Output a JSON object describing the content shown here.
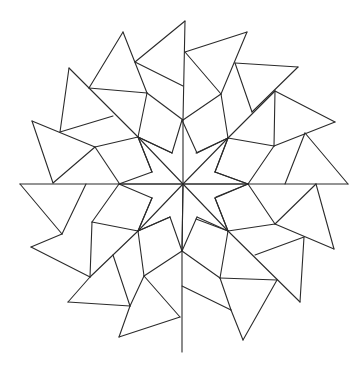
{
  "drawing": {
    "title": "Rotational geometric mandala line drawing",
    "stroke_color": "#2b2b2b",
    "background_color": "#ffffff",
    "center": [
      183,
      184
    ],
    "segments": [
      [
        185,
        21,
        135,
        62
      ],
      [
        185,
        21,
        183,
        120
      ],
      [
        135,
        62,
        183,
        86
      ],
      [
        123,
        32,
        89,
        88
      ],
      [
        123,
        32,
        147,
        93
      ],
      [
        89,
        88,
        147,
        93
      ],
      [
        147,
        93,
        138,
        137
      ],
      [
        147,
        93,
        183,
        120
      ],
      [
        69,
        68,
        60,
        132
      ],
      [
        69,
        68,
        138,
        137
      ],
      [
        60,
        132,
        113,
        116
      ],
      [
        32,
        121,
        53,
        183
      ],
      [
        32,
        121,
        95,
        147
      ],
      [
        95,
        147,
        53,
        183
      ],
      [
        95,
        147,
        138,
        137
      ],
      [
        95,
        147,
        119,
        183
      ],
      [
        138,
        137,
        172,
        153
      ],
      [
        138,
        137,
        152,
        172
      ],
      [
        185,
        52,
        247,
        32
      ],
      [
        247,
        32,
        221,
        94
      ],
      [
        185,
        52,
        221,
        94
      ],
      [
        183,
        120,
        221,
        94
      ],
      [
        235,
        63,
        298,
        67
      ],
      [
        298,
        67,
        252,
        112
      ],
      [
        235,
        63,
        252,
        112
      ],
      [
        221,
        94,
        228,
        138
      ],
      [
        275,
        91,
        335,
        122
      ],
      [
        275,
        91,
        274,
        146
      ],
      [
        335,
        122,
        274,
        146
      ],
      [
        275,
        91,
        228,
        138
      ],
      [
        228,
        138,
        274,
        146
      ],
      [
        228,
        138,
        196,
        153
      ],
      [
        228,
        138,
        215,
        172
      ],
      [
        305,
        133,
        348,
        184
      ],
      [
        305,
        133,
        285,
        184
      ],
      [
        274,
        146,
        248,
        184
      ],
      [
        20,
        184,
        348,
        184
      ],
      [
        248,
        184,
        215,
        172
      ],
      [
        248,
        184,
        216,
        197
      ],
      [
        316,
        184,
        334,
        249
      ],
      [
        316,
        184,
        275,
        224
      ],
      [
        248,
        184,
        275,
        224
      ],
      [
        275,
        224,
        228,
        231
      ],
      [
        334,
        249,
        275,
        224
      ],
      [
        304,
        237,
        255,
        255
      ],
      [
        304,
        237,
        300,
        302
      ],
      [
        228,
        231,
        300,
        302
      ],
      [
        228,
        231,
        215,
        198
      ],
      [
        228,
        231,
        196,
        219
      ],
      [
        228,
        231,
        220,
        278
      ],
      [
        220,
        278,
        277,
        280
      ],
      [
        277,
        280,
        243,
        340
      ],
      [
        220,
        278,
        231,
        310
      ],
      [
        231,
        310,
        243,
        340
      ],
      [
        231,
        310,
        182,
        286
      ],
      [
        182,
        251,
        220,
        278
      ],
      [
        182,
        251,
        182,
        352
      ],
      [
        182,
        251,
        183,
        184
      ],
      [
        20,
        184,
        62,
        234
      ],
      [
        86,
        184,
        62,
        234
      ],
      [
        119,
        184,
        92,
        222
      ],
      [
        92,
        222,
        138,
        231
      ],
      [
        92,
        222,
        90,
        277
      ],
      [
        31,
        247,
        62,
        234
      ],
      [
        31,
        247,
        90,
        277
      ],
      [
        90,
        277,
        138,
        231
      ],
      [
        138,
        231,
        152,
        198
      ],
      [
        138,
        231,
        170,
        217
      ],
      [
        138,
        231,
        144,
        276
      ],
      [
        144,
        276,
        182,
        251
      ],
      [
        113,
        255,
        130,
        306
      ],
      [
        90,
        277,
        68,
        302
      ],
      [
        68,
        302,
        130,
        306
      ],
      [
        130,
        306,
        144,
        276
      ],
      [
        130,
        306,
        119,
        337
      ],
      [
        119,
        337,
        180,
        317
      ],
      [
        144,
        276,
        180,
        317
      ],
      [
        183,
        184,
        183,
        120
      ],
      [
        183,
        184,
        182,
        251
      ],
      [
        183,
        184,
        138,
        137
      ],
      [
        183,
        184,
        228,
        138
      ],
      [
        183,
        184,
        228,
        231
      ],
      [
        183,
        184,
        138,
        231
      ],
      [
        183,
        184,
        120,
        184
      ],
      [
        183,
        184,
        248,
        184
      ],
      [
        182,
        120,
        172,
        153
      ],
      [
        182,
        120,
        197,
        153
      ],
      [
        228,
        138,
        197,
        153
      ],
      [
        228,
        138,
        215,
        172
      ],
      [
        248,
        184,
        215,
        172
      ],
      [
        248,
        184,
        215,
        198
      ],
      [
        228,
        231,
        215,
        198
      ],
      [
        228,
        231,
        197,
        217
      ],
      [
        182,
        251,
        197,
        217
      ],
      [
        182,
        251,
        170,
        217
      ],
      [
        138,
        231,
        170,
        217
      ],
      [
        138,
        231,
        152,
        198
      ],
      [
        119,
        184,
        152,
        198
      ],
      [
        119,
        184,
        152,
        172
      ],
      [
        138,
        137,
        152,
        172
      ],
      [
        138,
        137,
        172,
        153
      ]
    ]
  }
}
